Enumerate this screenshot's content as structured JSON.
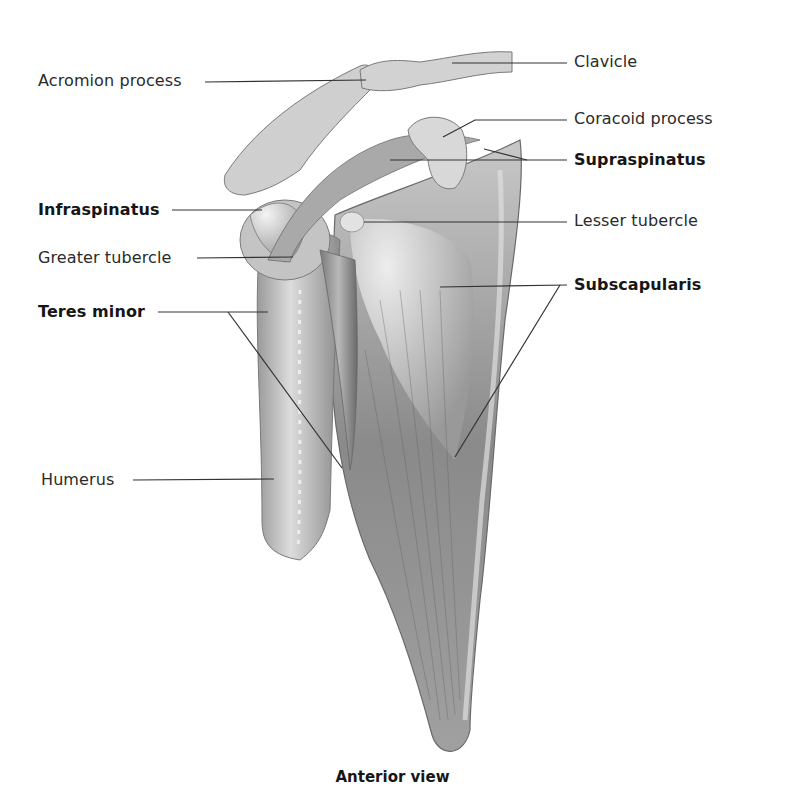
{
  "figure": {
    "caption": "Anterior view",
    "labels": {
      "acromion_process": "Acromion process",
      "clavicle": "Clavicle",
      "coracoid_process": "Coracoid process",
      "supraspinatus": "Supraspinatus",
      "infraspinatus": "Infraspinatus",
      "lesser_tubercle": "Lesser tubercle",
      "greater_tubercle": "Greater tubercle",
      "subscapularis": "Subscapularis",
      "teres_minor": "Teres minor",
      "humerus": "Humerus"
    },
    "bold_labels": [
      "Supraspinatus",
      "Infraspinatus",
      "Subscapularis",
      "Teres minor"
    ],
    "colors": {
      "background": "#ffffff",
      "bone_light": "#d9d9d9",
      "bone_mid": "#a8a8a8",
      "muscle_dark": "#6e6e6e",
      "leader_line": "#333333",
      "text": "#231f20"
    }
  }
}
